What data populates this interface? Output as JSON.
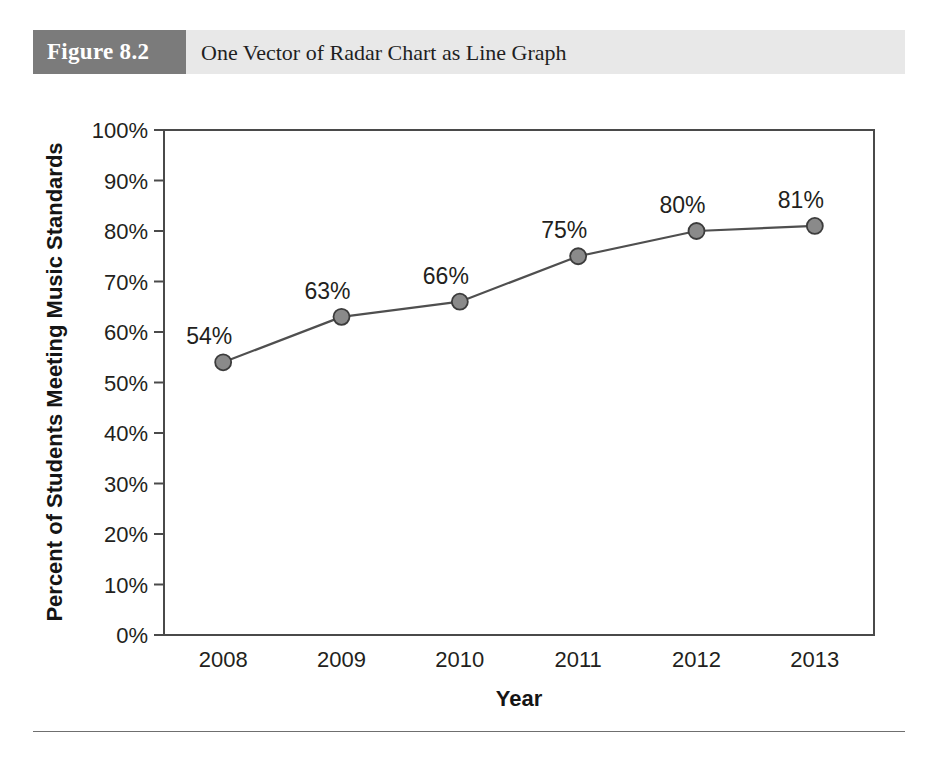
{
  "figure": {
    "number_label": "Figure 8.2",
    "title": "One Vector of Radar Chart as Line Graph",
    "number_box_color": "#7b7b7b",
    "bar_color": "#e8e8e8"
  },
  "chart_data": {
    "type": "line",
    "title": "",
    "subtitle": "",
    "xlabel": "Year",
    "ylabel": "Percent of Students Meeting Music Standards",
    "categories": [
      "2008",
      "2009",
      "2010",
      "2011",
      "2012",
      "2013"
    ],
    "values": [
      54,
      63,
      66,
      75,
      80,
      81
    ],
    "point_labels": [
      "54%",
      "63%",
      "66%",
      "75%",
      "80%",
      "81%"
    ],
    "ylim": [
      0,
      100
    ],
    "ytick_values": [
      0,
      10,
      20,
      30,
      40,
      50,
      60,
      70,
      80,
      90,
      100
    ],
    "ytick_labels": [
      "0%",
      "10%",
      "20%",
      "30%",
      "40%",
      "50%",
      "60%",
      "70%",
      "80%",
      "90%",
      "100%"
    ],
    "grid": false,
    "legend": false,
    "legend_position": "none",
    "series": [
      {
        "name": "Percent of Students Meeting Music Standards",
        "values": [
          54,
          63,
          66,
          75,
          80,
          81
        ]
      }
    ],
    "colors": {
      "line": "#4f4f4f",
      "marker_fill": "#8a8a8a",
      "marker_stroke": "#3c3c3c",
      "axis": "#4a4a4a",
      "text": "#231f20"
    }
  }
}
